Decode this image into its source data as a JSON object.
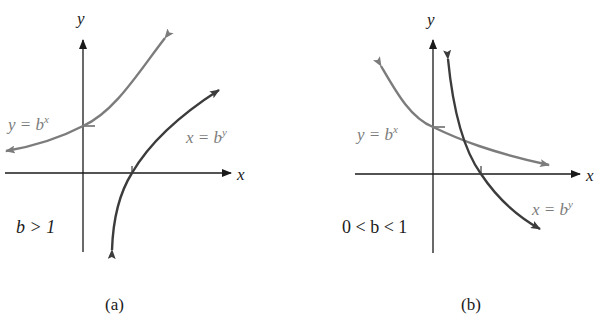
{
  "figure": {
    "panels": [
      {
        "id": "a",
        "caption": "(a)",
        "condition": "b > 1",
        "x_axis_label": "x",
        "y_axis_label": "y",
        "curves": [
          {
            "name": "exponential",
            "equation_base": "y = b",
            "equation_exp": "x",
            "color": "#7c7c7c"
          },
          {
            "name": "logarithmic",
            "equation_base": "x = b",
            "equation_exp": "y",
            "color": "#3c3c3c"
          }
        ]
      },
      {
        "id": "b",
        "caption": "(b)",
        "condition": "0 < b < 1",
        "x_axis_label": "x",
        "y_axis_label": "y",
        "curves": [
          {
            "name": "exponential",
            "equation_base": "y = b",
            "equation_exp": "x",
            "color": "#7c7c7c"
          },
          {
            "name": "logarithmic",
            "equation_base": "x = b",
            "equation_exp": "y",
            "color": "#3c3c3c"
          }
        ]
      }
    ]
  }
}
